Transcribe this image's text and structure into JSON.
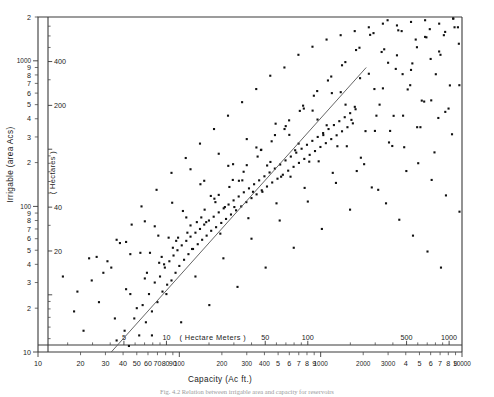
{
  "figure": {
    "title": "",
    "caption_partial": "Fig. 4.2 Relation between irrigable area and capacity for reservoirs"
  },
  "chart_data": {
    "type": "scatter",
    "title": "",
    "xlabel": "Capacity (Ac ft.)",
    "ylabel": "Irrigable (area  Acs)",
    "xlabel_inner": "( Hectare  Meters )",
    "ylabel_inner": "( Hectares )",
    "xscale": "log",
    "yscale": "log",
    "xlim": [
      10,
      10000
    ],
    "ylim": [
      10,
      2000
    ],
    "grid": false,
    "legend": "none",
    "x_ticks_outer": [
      "10",
      "20",
      "30",
      "40",
      "50",
      "60",
      "70",
      "80",
      "90",
      "100",
      "200",
      "300",
      "400",
      "5",
      "6",
      "7",
      "8",
      "9",
      "1000",
      "2000",
      "3000",
      "4",
      "5",
      "6",
      "7",
      "8",
      "9",
      "10000"
    ],
    "x_ticks_inner": [
      "5",
      "10",
      "50",
      "100",
      "500",
      "1000"
    ],
    "y_ticks_outer": [
      "10",
      "2",
      "3",
      "4",
      "5",
      "6",
      "7",
      "8",
      "9",
      "100",
      "2",
      "3",
      "4",
      "5",
      "6",
      "7",
      "8",
      "9",
      "1000",
      "2"
    ],
    "y_ticks_inner": [
      "20",
      "40",
      "200",
      "400"
    ],
    "n_points": 268,
    "trendline": {
      "type": "linear-on-loglog",
      "x_start": 33,
      "y_start": 10,
      "x_end": 2100,
      "y_end": 900
    },
    "points": [
      [
        36,
        12
      ],
      [
        41,
        14
      ],
      [
        44,
        11
      ],
      [
        48,
        17
      ],
      [
        52,
        13
      ],
      [
        55,
        21
      ],
      [
        58,
        16
      ],
      [
        61,
        25
      ],
      [
        64,
        19
      ],
      [
        67,
        30
      ],
      [
        70,
        22
      ],
      [
        73,
        33
      ],
      [
        76,
        26
      ],
      [
        79,
        38
      ],
      [
        82,
        29
      ],
      [
        85,
        42
      ],
      [
        88,
        31
      ],
      [
        91,
        46
      ],
      [
        94,
        35
      ],
      [
        97,
        50
      ],
      [
        100,
        39
      ],
      [
        104,
        54
      ],
      [
        108,
        43
      ],
      [
        112,
        58
      ],
      [
        116,
        47
      ],
      [
        120,
        62
      ],
      [
        125,
        51
      ],
      [
        130,
        66
      ],
      [
        135,
        55
      ],
      [
        140,
        70
      ],
      [
        145,
        59
      ],
      [
        150,
        75
      ],
      [
        156,
        63
      ],
      [
        162,
        80
      ],
      [
        168,
        68
      ],
      [
        175,
        85
      ],
      [
        182,
        72
      ],
      [
        190,
        91
      ],
      [
        198,
        77
      ],
      [
        206,
        97
      ],
      [
        214,
        82
      ],
      [
        223,
        103
      ],
      [
        232,
        88
      ],
      [
        242,
        110
      ],
      [
        252,
        94
      ],
      [
        263,
        117
      ],
      [
        274,
        100
      ],
      [
        286,
        125
      ],
      [
        298,
        107
      ],
      [
        311,
        133
      ],
      [
        324,
        114
      ],
      [
        338,
        142
      ],
      [
        352,
        121
      ],
      [
        367,
        151
      ],
      [
        383,
        129
      ],
      [
        400,
        161
      ],
      [
        417,
        137
      ],
      [
        435,
        171
      ],
      [
        454,
        146
      ],
      [
        474,
        182
      ],
      [
        495,
        155
      ],
      [
        517,
        194
      ],
      [
        540,
        165
      ],
      [
        564,
        207
      ],
      [
        589,
        176
      ],
      [
        615,
        220
      ],
      [
        643,
        187
      ],
      [
        672,
        234
      ],
      [
        702,
        199
      ],
      [
        733,
        249
      ],
      [
        766,
        212
      ],
      [
        800,
        265
      ],
      [
        836,
        226
      ],
      [
        873,
        282
      ],
      [
        912,
        240
      ],
      [
        953,
        300
      ],
      [
        996,
        256
      ],
      [
        1041,
        319
      ],
      [
        1088,
        272
      ],
      [
        1137,
        340
      ],
      [
        1188,
        290
      ],
      [
        1241,
        362
      ],
      [
        1297,
        308
      ],
      [
        1355,
        385
      ],
      [
        1416,
        328
      ],
      [
        1480,
        410
      ],
      [
        1547,
        350
      ],
      [
        1617,
        437
      ],
      [
        1690,
        372
      ],
      [
        1766,
        465
      ],
      [
        18,
        19
      ],
      [
        21,
        14
      ],
      [
        24,
        31
      ],
      [
        27,
        22
      ],
      [
        31,
        42
      ],
      [
        35,
        17
      ],
      [
        38,
        56
      ],
      [
        42,
        27
      ],
      [
        46,
        75
      ],
      [
        50,
        20
      ],
      [
        54,
        100
      ],
      [
        59,
        35
      ],
      [
        64,
        13
      ],
      [
        69,
        130
      ],
      [
        75,
        45
      ],
      [
        81,
        25
      ],
      [
        88,
        170
      ],
      [
        95,
        58
      ],
      [
        103,
        16
      ],
      [
        111,
        215
      ],
      [
        120,
        74
      ],
      [
        130,
        33
      ],
      [
        140,
        270
      ],
      [
        151,
        95
      ],
      [
        163,
        21
      ],
      [
        176,
        340
      ],
      [
        190,
        120
      ],
      [
        205,
        44
      ],
      [
        221,
        420
      ],
      [
        239,
        152
      ],
      [
        258,
        28
      ],
      [
        278,
        520
      ],
      [
        300,
        192
      ],
      [
        324,
        60
      ],
      [
        350,
        640
      ],
      [
        378,
        244
      ],
      [
        408,
        38
      ],
      [
        440,
        790
      ],
      [
        475,
        309
      ],
      [
        513,
        80
      ],
      [
        554,
        900
      ],
      [
        598,
        390
      ],
      [
        645,
        52
      ],
      [
        696,
        1100
      ],
      [
        751,
        492
      ],
      [
        811,
        108
      ],
      [
        875,
        1250
      ],
      [
        945,
        620
      ],
      [
        1020,
        70
      ],
      [
        1101,
        1400
      ],
      [
        1188,
        780
      ],
      [
        1283,
        145
      ],
      [
        1385,
        1500
      ],
      [
        1495,
        980
      ],
      [
        1614,
        95
      ],
      [
        1742,
        1600
      ],
      [
        1881,
        1230
      ],
      [
        2030,
        195
      ],
      [
        2191,
        1700
      ],
      [
        2365,
        1550
      ],
      [
        2553,
        130
      ],
      [
        2756,
        1800
      ],
      [
        2975,
        1900
      ],
      [
        3211,
        260
      ],
      [
        3466,
        1750
      ],
      [
        3741,
        1600
      ],
      [
        4038,
        175
      ],
      [
        4359,
        1850
      ],
      [
        4705,
        1400
      ],
      [
        5079,
        350
      ],
      [
        5482,
        1900
      ],
      [
        5917,
        1650
      ],
      [
        6387,
        235
      ],
      [
        6894,
        1800
      ],
      [
        7441,
        1500
      ],
      [
        8032,
        470
      ],
      [
        8670,
        1950
      ],
      [
        9359,
        1700
      ],
      [
        120,
        180
      ],
      [
        150,
        150
      ],
      [
        190,
        230
      ],
      [
        240,
        195
      ],
      [
        300,
        290
      ],
      [
        380,
        245
      ],
      [
        480,
        370
      ],
      [
        600,
        310
      ],
      [
        760,
        470
      ],
      [
        950,
        395
      ],
      [
        1200,
        600
      ],
      [
        1500,
        500
      ],
      [
        1900,
        760
      ],
      [
        2400,
        640
      ],
      [
        3000,
        970
      ],
      [
        3800,
        810
      ],
      [
        4800,
        1240
      ],
      [
        6000,
        1030
      ],
      [
        7600,
        1580
      ],
      [
        9500,
        1310
      ],
      [
        62,
        48
      ],
      [
        78,
        40
      ],
      [
        98,
        61
      ],
      [
        123,
        51
      ],
      [
        155,
        78
      ],
      [
        195,
        65
      ],
      [
        245,
        99
      ],
      [
        308,
        83
      ],
      [
        387,
        126
      ],
      [
        487,
        105
      ],
      [
        612,
        160
      ],
      [
        770,
        134
      ],
      [
        968,
        204
      ],
      [
        1218,
        170
      ],
      [
        1531,
        259
      ],
      [
        1925,
        216
      ],
      [
        2421,
        330
      ],
      [
        3045,
        275
      ],
      [
        3829,
        420
      ],
      [
        4816,
        350
      ],
      [
        6057,
        535
      ],
      [
        7617,
        446
      ],
      [
        9579,
        680
      ],
      [
        26,
        45
      ],
      [
        33,
        38
      ],
      [
        42,
        57
      ],
      [
        53,
        48
      ],
      [
        67,
        73
      ],
      [
        84,
        61
      ],
      [
        106,
        93
      ],
      [
        133,
        78
      ],
      [
        167,
        118
      ],
      [
        210,
        99
      ],
      [
        264,
        150
      ],
      [
        332,
        126
      ],
      [
        418,
        191
      ],
      [
        525,
        160
      ],
      [
        660,
        243
      ],
      [
        830,
        203
      ],
      [
        1044,
        309
      ],
      [
        1313,
        259
      ],
      [
        1651,
        393
      ],
      [
        2076,
        329
      ],
      [
        2611,
        500
      ],
      [
        3283,
        419
      ],
      [
        4128,
        636
      ],
      [
        5191,
        533
      ],
      [
        6528,
        809
      ],
      [
        8209,
        678
      ],
      [
        45,
        25
      ],
      [
        57,
        32
      ],
      [
        72,
        41
      ],
      [
        90,
        52
      ],
      [
        114,
        66
      ],
      [
        143,
        84
      ],
      [
        180,
        107
      ],
      [
        226,
        136
      ],
      [
        285,
        173
      ],
      [
        358,
        220
      ],
      [
        450,
        280
      ],
      [
        566,
        356
      ],
      [
        712,
        453
      ],
      [
        895,
        576
      ],
      [
        1126,
        733
      ],
      [
        1416,
        932
      ],
      [
        1780,
        1186
      ],
      [
        2239,
        1508
      ],
      [
        2816,
        1200
      ],
      [
        3541,
        1620
      ],
      [
        4453,
        960
      ],
      [
        5600,
        1450
      ],
      [
        7042,
        1100
      ],
      [
        8856,
        1700
      ],
      [
        15,
        33
      ],
      [
        19,
        26
      ],
      [
        23,
        44
      ],
      [
        29,
        35
      ],
      [
        36,
        59
      ],
      [
        45,
        47
      ],
      [
        57,
        79
      ],
      [
        71,
        63
      ],
      [
        89,
        106
      ],
      [
        112,
        84
      ],
      [
        141,
        142
      ],
      [
        177,
        113
      ],
      [
        222,
        190
      ],
      [
        279,
        151
      ],
      [
        351,
        254
      ],
      [
        441,
        202
      ],
      [
        555,
        340
      ],
      [
        698,
        270
      ],
      [
        877,
        455
      ],
      [
        1103,
        361
      ],
      [
        1387,
        609
      ],
      [
        1744,
        483
      ],
      [
        2192,
        815
      ],
      [
        2757,
        647
      ],
      [
        3466,
        1091
      ],
      [
        4358,
        866
      ],
      [
        5480,
        1460
      ],
      [
        6890,
        1159
      ],
      [
        8663,
        1953
      ],
      [
        2480,
        420
      ],
      [
        3100,
        330
      ],
      [
        3900,
        255
      ],
      [
        4900,
        198
      ],
      [
        6100,
        152
      ],
      [
        7700,
        119
      ],
      [
        9600,
        92
      ],
      [
        2700,
        1150
      ],
      [
        3400,
        880
      ],
      [
        4300,
        680
      ],
      [
        5400,
        525
      ],
      [
        6800,
        405
      ],
      [
        8500,
        313
      ],
      [
        1800,
        175
      ],
      [
        2300,
        135
      ],
      [
        2900,
        105
      ],
      [
        3600,
        81
      ],
      [
        4500,
        63
      ],
      [
        5700,
        49
      ],
      [
        7100,
        38
      ]
    ]
  }
}
